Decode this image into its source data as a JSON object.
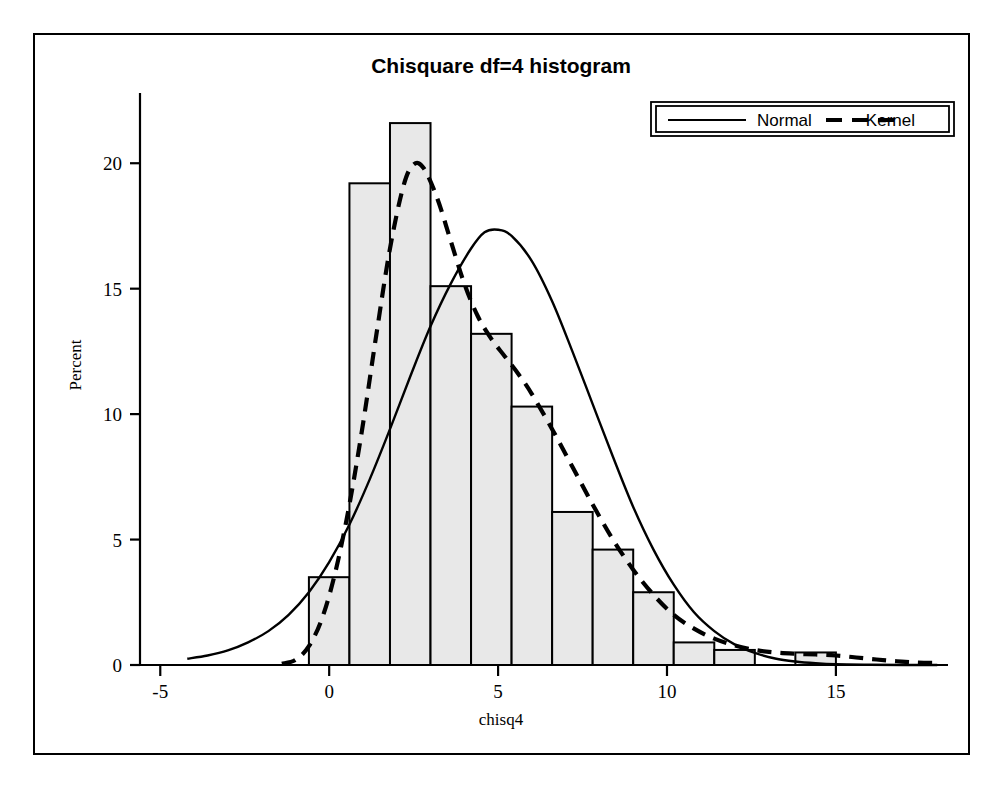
{
  "chart_data": {
    "type": "bar",
    "title": "Chisquare df=4 histogram",
    "xlabel": "chisq4",
    "ylabel": "Percent",
    "xlim": [
      -5.6,
      18.2
    ],
    "ylim": [
      0,
      22.6
    ],
    "xticks": [
      -5,
      0,
      5,
      10,
      15
    ],
    "xtick_labels": [
      "-5",
      "0",
      "5",
      "10",
      "15"
    ],
    "yticks": [
      0,
      5,
      10,
      15,
      20
    ],
    "ytick_labels": [
      "0",
      "5",
      "10",
      "15",
      "20"
    ],
    "grid": false,
    "legend_position": "top-right",
    "bin_width": 1.2,
    "bin_start": -0.6,
    "bin_midpoints": [
      0.0,
      1.2,
      2.4,
      3.6,
      4.8,
      6.0,
      7.2,
      8.4,
      9.6,
      10.8,
      12.0,
      14.4
    ],
    "bin_edges": [
      -0.6,
      0.6,
      1.8,
      3.0,
      4.2,
      5.4,
      6.6,
      7.8,
      9.0,
      10.2,
      11.4,
      12.6,
      13.8,
      15.0
    ],
    "categories": [
      "-0.6 to 0.6",
      "0.6 to 1.8",
      "1.8 to 3.0",
      "3.0 to 4.2",
      "4.2 to 5.4",
      "5.4 to 6.6",
      "6.6 to 7.8",
      "7.8 to 9.0",
      "9.0 to 10.2",
      "10.2 to 11.4",
      "11.4 to 12.6",
      "13.8 to 15.0"
    ],
    "values": [
      3.5,
      19.2,
      21.6,
      15.1,
      13.2,
      10.3,
      6.1,
      4.6,
      2.9,
      0.9,
      0.6,
      0.5
    ],
    "series": [
      {
        "name": "Normal",
        "style": "solid",
        "points": [
          [
            -4.2,
            0.25
          ],
          [
            -3.6,
            0.38
          ],
          [
            -3.0,
            0.58
          ],
          [
            -2.4,
            0.9
          ],
          [
            -1.8,
            1.35
          ],
          [
            -1.2,
            2.0
          ],
          [
            -0.6,
            2.9
          ],
          [
            0.0,
            4.1
          ],
          [
            0.6,
            5.6
          ],
          [
            1.2,
            7.4
          ],
          [
            1.8,
            9.4
          ],
          [
            2.4,
            11.5
          ],
          [
            3.0,
            13.5
          ],
          [
            3.6,
            15.2
          ],
          [
            4.2,
            16.6
          ],
          [
            4.6,
            17.25
          ],
          [
            5.0,
            17.35
          ],
          [
            5.4,
            17.1
          ],
          [
            6.0,
            16.1
          ],
          [
            6.6,
            14.5
          ],
          [
            7.2,
            12.5
          ],
          [
            7.8,
            10.4
          ],
          [
            8.4,
            8.3
          ],
          [
            9.0,
            6.3
          ],
          [
            9.6,
            4.6
          ],
          [
            10.2,
            3.2
          ],
          [
            10.8,
            2.1
          ],
          [
            11.4,
            1.35
          ],
          [
            12.0,
            0.82
          ],
          [
            12.6,
            0.48
          ],
          [
            13.2,
            0.26
          ],
          [
            13.8,
            0.14
          ],
          [
            14.4,
            0.07
          ],
          [
            15.0,
            0.03
          ],
          [
            16.0,
            0.01
          ],
          [
            17.0,
            0.0
          ],
          [
            18.0,
            0.0
          ]
        ]
      },
      {
        "name": "Kernel",
        "style": "dashed",
        "points": [
          [
            -1.4,
            0.05
          ],
          [
            -1.0,
            0.2
          ],
          [
            -0.6,
            0.75
          ],
          [
            -0.2,
            1.9
          ],
          [
            0.2,
            3.8
          ],
          [
            0.6,
            6.4
          ],
          [
            1.0,
            9.6
          ],
          [
            1.4,
            13.2
          ],
          [
            1.8,
            16.6
          ],
          [
            2.2,
            19.1
          ],
          [
            2.5,
            19.95
          ],
          [
            2.8,
            19.8
          ],
          [
            3.2,
            18.6
          ],
          [
            3.6,
            16.9
          ],
          [
            4.0,
            15.2
          ],
          [
            4.4,
            13.9
          ],
          [
            4.8,
            13.0
          ],
          [
            5.2,
            12.3
          ],
          [
            5.6,
            11.6
          ],
          [
            6.0,
            10.8
          ],
          [
            6.6,
            9.4
          ],
          [
            7.2,
            7.9
          ],
          [
            7.8,
            6.4
          ],
          [
            8.4,
            5.0
          ],
          [
            9.0,
            3.8
          ],
          [
            9.6,
            2.8
          ],
          [
            10.2,
            2.0
          ],
          [
            10.8,
            1.45
          ],
          [
            11.4,
            1.05
          ],
          [
            12.0,
            0.78
          ],
          [
            12.6,
            0.6
          ],
          [
            13.2,
            0.5
          ],
          [
            13.8,
            0.45
          ],
          [
            14.4,
            0.42
          ],
          [
            15.0,
            0.38
          ],
          [
            15.6,
            0.3
          ],
          [
            16.2,
            0.22
          ],
          [
            16.8,
            0.15
          ],
          [
            17.4,
            0.1
          ],
          [
            18.0,
            0.08
          ]
        ]
      }
    ],
    "legend": [
      {
        "label": "Normal",
        "style": "solid"
      },
      {
        "label": "Kernel",
        "style": "dashed"
      }
    ]
  }
}
